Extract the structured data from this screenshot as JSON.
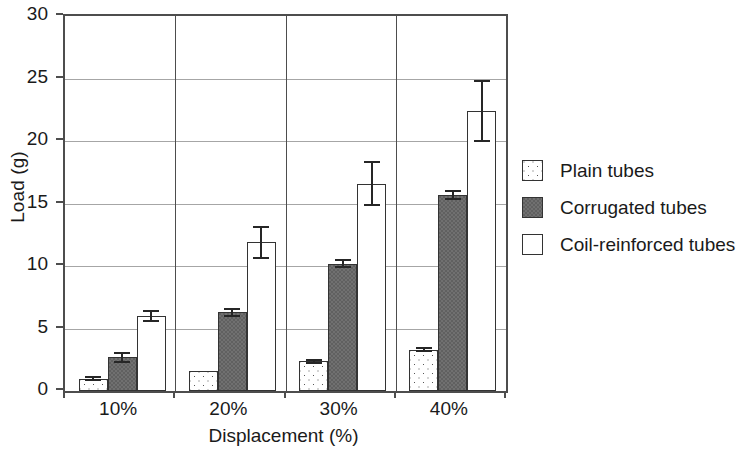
{
  "chart_data": {
    "type": "bar",
    "title": "",
    "xlabel": "Displacement (%)",
    "ylabel": "Load (g)",
    "categories": [
      "10%",
      "20%",
      "30%",
      "40%"
    ],
    "ylim": [
      0,
      30
    ],
    "yticks": [
      0,
      5,
      10,
      15,
      20,
      25,
      30
    ],
    "ytick_labels": [
      "0",
      "5",
      "10",
      "15",
      "20",
      "25",
      "30"
    ],
    "grid": "horizontal",
    "legend_position": "right",
    "series": [
      {
        "name": "Plain tubes",
        "fill": "#ffffff",
        "pattern": "dotted",
        "values": [
          1.0,
          1.6,
          2.4,
          3.3
        ],
        "errors": [
          0.2,
          0.0,
          0.2,
          0.2
        ]
      },
      {
        "name": "Corrugated tubes",
        "fill": "#606060",
        "pattern": "solid-dark-gray",
        "values": [
          2.7,
          6.3,
          10.2,
          15.7
        ],
        "errors": [
          0.45,
          0.35,
          0.35,
          0.4
        ]
      },
      {
        "name": "Coil-reinforced tubes",
        "fill": "#ffffff",
        "pattern": "plain-white",
        "values": [
          6.0,
          11.9,
          16.6,
          22.4
        ],
        "errors": [
          0.5,
          1.3,
          1.8,
          2.5
        ]
      }
    ]
  }
}
